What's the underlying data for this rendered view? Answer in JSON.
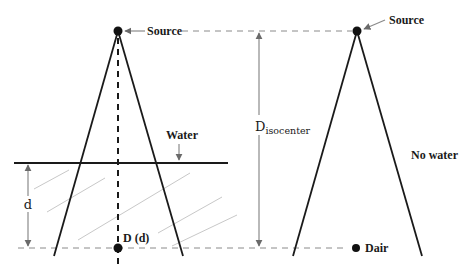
{
  "diagram": {
    "labels": {
      "source_left": "Source",
      "source_right": "Source",
      "water": "Water",
      "depth": "d",
      "dose_depth": "D (d)",
      "d_isocenter_main": "D",
      "d_isocenter_sub": "isocenter",
      "no_water": "No water",
      "dair": "Dair"
    },
    "setups": [
      {
        "name": "with-water",
        "description": "Point source beam through water to depth d, dose D(d)"
      },
      {
        "name": "no-water",
        "description": "Point source beam in air, dose Dair"
      }
    ],
    "colors": {
      "line": "#1a1a1a",
      "reference": "#8a8a8a",
      "hatch": "#c8c8c8"
    }
  }
}
